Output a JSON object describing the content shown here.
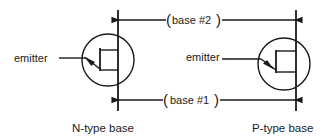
{
  "diagram": {
    "colors": {
      "ink": "#1a1a1a",
      "background": "#ffffff"
    },
    "left_symbol": {
      "caption": "N-type base",
      "emitter_label": "emitter",
      "emitter_arrow": "pointing-into-base"
    },
    "right_symbol": {
      "caption": "P-type base",
      "emitter_label": "emitter",
      "emitter_arrow": "pointing-out-of-base"
    },
    "connections": {
      "top": {
        "label": "base #2",
        "open_paren": "(",
        "close_paren": ")"
      },
      "bottom": {
        "label": "base #1",
        "open_paren": "(",
        "close_paren": ")"
      }
    }
  }
}
